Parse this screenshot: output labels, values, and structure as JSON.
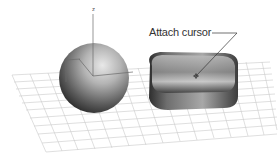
{
  "scene": {
    "background": "#ffffff",
    "grid_color": "#c8c8c8",
    "objects": [
      {
        "name": "sphere",
        "shape": "sphere"
      },
      {
        "name": "chamfer-box",
        "shape": "rounded-box"
      }
    ],
    "axis": {
      "z_label": "z"
    }
  },
  "callout": {
    "label": "Attach cursor",
    "color": "#333333"
  }
}
